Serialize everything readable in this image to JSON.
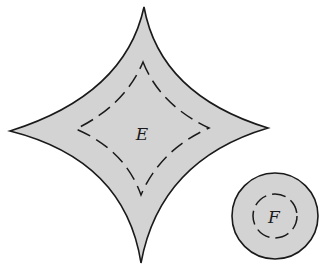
{
  "diagram": {
    "colors": {
      "fill": "#d3d3d3",
      "stroke": "#1a1a1a",
      "background": "#ffffff"
    },
    "shapes": [
      {
        "id": "astroid",
        "label": "E",
        "type": "four-point-star",
        "cusps": {
          "top": [
            144,
            7
          ],
          "right": [
            268,
            128
          ],
          "bottom": [
            141,
            263
          ],
          "left": [
            10,
            131
          ]
        },
        "inner_dashed": {
          "top": [
            143,
            62
          ],
          "right": [
            209,
            128
          ],
          "bottom": [
            141,
            195
          ],
          "left": [
            76,
            129
          ]
        }
      },
      {
        "id": "circle",
        "label": "F",
        "type": "circle",
        "center": [
          275,
          216
        ],
        "radius": 43,
        "inner_dashed_radius": 22
      }
    ]
  }
}
